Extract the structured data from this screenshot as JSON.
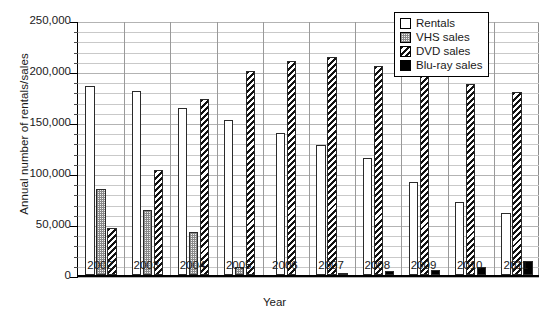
{
  "chart_data": {
    "type": "bar",
    "title": "",
    "xlabel": "Year",
    "ylabel": "Annual number of rentals/sales",
    "categories": [
      "2002",
      "2003",
      "2004",
      "2005",
      "2006",
      "2007",
      "2008",
      "2009",
      "2010",
      "2011"
    ],
    "ylim": [
      0,
      250000
    ],
    "ytick_values": [
      0,
      50000,
      100000,
      150000,
      200000,
      250000
    ],
    "ytick_labels": [
      "0",
      "50,000",
      "100,000",
      "150,000",
      "200,000",
      "250,000"
    ],
    "minor_tick_step": 10000,
    "grid": "horizontal-minor",
    "legend_position": "top-right",
    "series": [
      {
        "name": "Rentals",
        "pattern": "open",
        "values": [
          185000,
          180000,
          164000,
          152000,
          139000,
          127000,
          115000,
          91000,
          72000,
          61000
        ]
      },
      {
        "name": "VHS sales",
        "pattern": "dotted-gray",
        "values": [
          84000,
          64000,
          42000,
          8000,
          0,
          0,
          0,
          0,
          0,
          0
        ]
      },
      {
        "name": "DVD sales",
        "pattern": "diagonal",
        "values": [
          46000,
          103000,
          173000,
          200000,
          210000,
          214000,
          205000,
          196000,
          187000,
          179000
        ]
      },
      {
        "name": "Blu-ray sales",
        "pattern": "solid-black",
        "values": [
          0,
          0,
          0,
          0,
          0,
          2000,
          3500,
          5000,
          8000,
          14000
        ]
      }
    ]
  },
  "legend": {
    "items": [
      {
        "label": "Rentals"
      },
      {
        "label": "VHS sales"
      },
      {
        "label": "DVD sales"
      },
      {
        "label": "Blu-ray sales"
      }
    ]
  }
}
